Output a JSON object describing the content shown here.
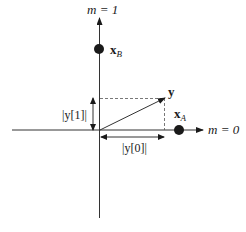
{
  "diagram": {
    "type": "signal-space constellation",
    "axes": {
      "vertical_label": "m = 1",
      "horizontal_label": "m = 0"
    },
    "points": [
      {
        "name": "x_B",
        "label_main": "x",
        "label_sub": "B"
      },
      {
        "name": "x_A",
        "label_main": "x",
        "label_sub": "A"
      }
    ],
    "vector": {
      "label": "y"
    },
    "projections": {
      "vertical": "|y[1]|",
      "horizontal": "|y[0]|"
    }
  },
  "colors": {
    "ink": "#1a1a1a",
    "background": "#ffffff"
  }
}
